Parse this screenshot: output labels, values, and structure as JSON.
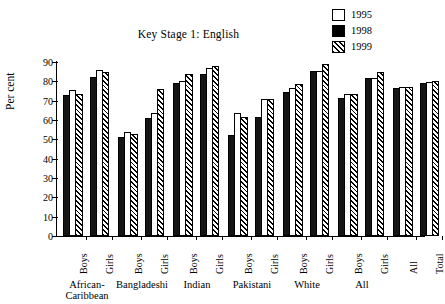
{
  "chart_data": {
    "type": "bar",
    "title": "Key Stage 1: English",
    "xlabel": "",
    "ylabel": "Per cent",
    "ylim": [
      0,
      90
    ],
    "yticks": [
      0,
      10,
      20,
      30,
      40,
      50,
      60,
      70,
      80,
      90
    ],
    "grid": false,
    "legend_position": "top-right",
    "categories": [
      "Boys",
      "Girls",
      "Boys",
      "Girls",
      "Boys",
      "Girls",
      "Boys",
      "Girls",
      "Boys",
      "Girls",
      "Boys",
      "Girls",
      "All",
      "Total"
    ],
    "groups": [
      {
        "label": "African-\nCaribbean",
        "line1": "African-",
        "line2": "Caribbean",
        "members": [
          "Boys",
          "Girls"
        ]
      },
      {
        "label": "Bangladeshi",
        "line1": "Bangladeshi",
        "line2": "",
        "members": [
          "Boys",
          "Girls"
        ]
      },
      {
        "label": "Indian",
        "line1": "Indian",
        "line2": "",
        "members": [
          "Boys",
          "Girls"
        ]
      },
      {
        "label": "Pakistani",
        "line1": "Pakistani",
        "line2": "",
        "members": [
          "Boys",
          "Girls"
        ]
      },
      {
        "label": "White",
        "line1": "White",
        "line2": "",
        "members": [
          "Boys",
          "Girls"
        ]
      },
      {
        "label": "All",
        "line1": "All",
        "line2": "",
        "members": [
          "Boys",
          "Girls"
        ]
      },
      {
        "label": "",
        "line1": "",
        "line2": "",
        "members": [
          "All",
          "Total"
        ]
      }
    ],
    "series": [
      {
        "name": "1995",
        "style": "white",
        "color": "#ffffff",
        "values": [
          75.5,
          86,
          54,
          63.5,
          80,
          87,
          63.5,
          71,
          76.5,
          85.5,
          73.5,
          81.5,
          77,
          79.5
        ]
      },
      {
        "name": "1998",
        "style": "black",
        "color": "#000000",
        "values": [
          73,
          82.5,
          51,
          61,
          79,
          84,
          52,
          61.5,
          74.5,
          85.5,
          71.5,
          81.5,
          76.5,
          79
        ]
      },
      {
        "name": "1999",
        "style": "hatched",
        "color": "#000000",
        "values": [
          73.5,
          85,
          53,
          76,
          84,
          88,
          61.5,
          71,
          78.5,
          89,
          73.5,
          85,
          77,
          80
        ]
      }
    ]
  },
  "legend": {
    "items": [
      {
        "label": "1995",
        "style": "white"
      },
      {
        "label": "1998",
        "style": "black"
      },
      {
        "label": "1999",
        "style": "hatched"
      }
    ]
  }
}
